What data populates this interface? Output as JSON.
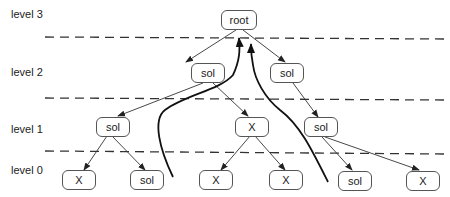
{
  "levels": [
    {
      "label": "level 3",
      "y": 14
    },
    {
      "label": "level 2",
      "y": 67
    },
    {
      "label": "level 1",
      "y": 122
    },
    {
      "label": "level 0",
      "y": 164
    }
  ],
  "dividers_y": [
    37,
    98,
    152
  ],
  "nodes": [
    {
      "id": "root",
      "label": "root",
      "level": 3,
      "cx": 239,
      "cy": 20,
      "w": 36
    },
    {
      "id": "l2a",
      "label": "sol",
      "level": 2,
      "cx": 208,
      "cy": 73,
      "w": 34
    },
    {
      "id": "l2b",
      "label": "sol",
      "level": 2,
      "cx": 287,
      "cy": 73,
      "w": 34
    },
    {
      "id": "l1a",
      "label": "sol",
      "level": 1,
      "cx": 112,
      "cy": 126,
      "w": 34
    },
    {
      "id": "l1b",
      "label": "X",
      "level": 1,
      "cx": 252,
      "cy": 126,
      "w": 34
    },
    {
      "id": "l1c",
      "label": "sol",
      "level": 1,
      "cx": 321,
      "cy": 127,
      "w": 34
    },
    {
      "id": "l0a",
      "label": "X",
      "level": 0,
      "cx": 79,
      "cy": 180,
      "w": 34
    },
    {
      "id": "l0b",
      "label": "sol",
      "level": 0,
      "cx": 147,
      "cy": 180,
      "w": 34
    },
    {
      "id": "l0c",
      "label": "X",
      "level": 0,
      "cx": 217,
      "cy": 180,
      "w": 34
    },
    {
      "id": "l0d",
      "label": "X",
      "level": 0,
      "cx": 286,
      "cy": 180,
      "w": 34
    },
    {
      "id": "l0e",
      "label": "sol",
      "level": 0,
      "cx": 355,
      "cy": 180,
      "w": 34
    },
    {
      "id": "l0f",
      "label": "X",
      "level": 0,
      "cx": 423,
      "cy": 180,
      "w": 34
    }
  ],
  "edges": [
    [
      "root",
      "l2a"
    ],
    [
      "root",
      "l2b"
    ],
    [
      "l2a",
      "l1a"
    ],
    [
      "l2a",
      "l1b"
    ],
    [
      "l2b",
      "l1c"
    ],
    [
      "l1a",
      "l0a"
    ],
    [
      "l1a",
      "l0b"
    ],
    [
      "l1b",
      "l0c"
    ],
    [
      "l1b",
      "l0d"
    ],
    [
      "l1c",
      "l0e"
    ],
    [
      "l1c",
      "l0f"
    ]
  ],
  "upward_arrows": [
    {
      "from": "bottom-left",
      "to": "root"
    },
    {
      "from": "bottom-right",
      "to": "root"
    }
  ]
}
